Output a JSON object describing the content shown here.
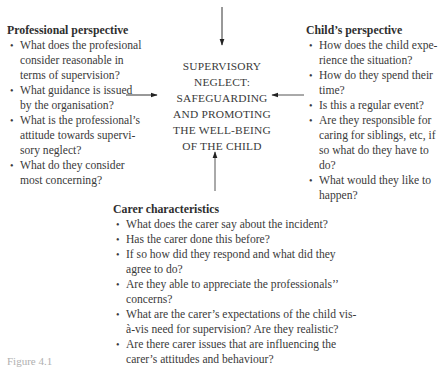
{
  "center": {
    "lines": [
      "SUPERVISORY",
      "NEGLECT:",
      "SAFEGUARDING",
      "AND PROMOTING",
      "THE WELL-BEING",
      "OF THE CHILD"
    ]
  },
  "professional": {
    "title": "Professional perspective",
    "items": [
      "What does the profesional consider reasonable in terms of supervision?",
      "What guidance is issued by the organisation?",
      "What is the professional’s attitude towards supervi-sory neglect?",
      "What do they consider most concerning?"
    ]
  },
  "child": {
    "title": "Child’s perspective",
    "items": [
      "How does the child expe-rience the situation?",
      "How do they spend their time?",
      "Is this a regular event?",
      "Are they responsible for caring for siblings, etc, if so what do they have to do?",
      "What would they like to happen?"
    ]
  },
  "carer": {
    "title": "Carer characteristics",
    "items": [
      "What does the carer say about the incident?",
      "Has the carer done this before?",
      "If so how did they respond and what did they agree to do?",
      "Are they able to appreciate the professionals’’ concerns?",
      "What are the carer’s expectations of the child vis-à-vis need for supervision? Are they realistic?",
      "Are there carer issues that are influencing the carer’s attitudes and behaviour?"
    ]
  },
  "bullet": "•",
  "caption": "Figure 4.1"
}
